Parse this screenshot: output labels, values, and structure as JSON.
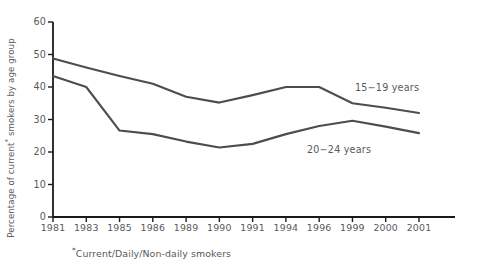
{
  "chart_data": {
    "type": "line",
    "title": "",
    "xlabel": "",
    "ylabel": "Percentage of current* smokers by age group",
    "footnote": "*Current/Daily/Non-daily smokers",
    "grid": false,
    "legend_position": "inline-right",
    "ylim": [
      0,
      60
    ],
    "yticks": [
      0,
      10,
      20,
      30,
      40,
      50,
      60
    ],
    "categories": [
      "1981",
      "1983",
      "1985",
      "1986",
      "1989",
      "1990",
      "1991",
      "1994",
      "1996",
      "1999",
      "2000",
      "2001"
    ],
    "series": [
      {
        "name": "15−19 years",
        "color": "#4d4d4f",
        "values": [
          48.8,
          46.0,
          43.4,
          41.0,
          37.0,
          35.2,
          37.5,
          40.0,
          40.0,
          35.0,
          33.6,
          32.0
        ]
      },
      {
        "name": "20−24 years",
        "color": "#4d4d4f",
        "values": [
          43.4,
          40.0,
          26.6,
          25.5,
          23.2,
          21.4,
          22.5,
          25.5,
          28.0,
          29.6,
          27.8,
          25.8
        ]
      }
    ],
    "annotations": [
      {
        "text": "15−19 years",
        "x_px": 355,
        "y_px": 89
      },
      {
        "text": "20−24 years",
        "x_px": 307,
        "y_px": 151
      }
    ]
  },
  "axis": {
    "y_tick_labels": [
      "60",
      "50",
      "40",
      "30",
      "20",
      "10",
      "0"
    ],
    "x_tick_labels": [
      "1981",
      "1983",
      "1985",
      "1986",
      "1989",
      "1990",
      "1991",
      "1994",
      "1996",
      "1999",
      "2000",
      "2001"
    ]
  },
  "colors": {
    "axis": "#1a1a1a",
    "line": "#4d4d4f",
    "text": "#58585a",
    "background": "#ffffff"
  }
}
